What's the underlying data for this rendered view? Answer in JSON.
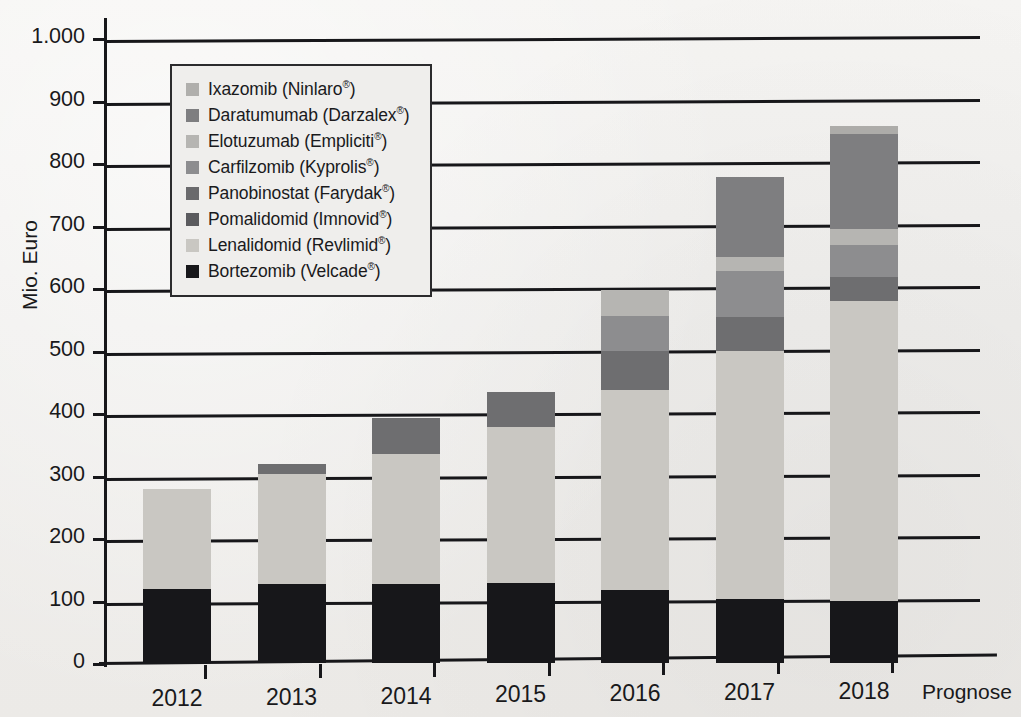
{
  "chart_data": {
    "type": "bar",
    "stacked": true,
    "title": "",
    "xlabel": "",
    "ylabel": "Mio. Euro",
    "ylim": [
      0,
      1000
    ],
    "ytick_labels": [
      "0",
      "100",
      "200",
      "300",
      "400",
      "500",
      "600",
      "700",
      "800",
      "900",
      "1.000"
    ],
    "ytick_values": [
      0,
      100,
      200,
      300,
      400,
      500,
      600,
      700,
      800,
      900,
      1000
    ],
    "grid": true,
    "legend_position": "upper-left-inside",
    "categories": [
      "2012",
      "2013",
      "2014",
      "2015",
      "2016",
      "2017",
      "2018"
    ],
    "annotation": "Prognose",
    "series": [
      {
        "name": "Bortezomib (Velcade®)",
        "color": "#17171a",
        "values": [
          118,
          127,
          127,
          128,
          117,
          103,
          100
        ]
      },
      {
        "name": "Lenalidomid (Revlimid®)",
        "color": "#c9c7c2",
        "values": [
          160,
          175,
          208,
          250,
          320,
          397,
          480
        ]
      },
      {
        "name": "Pomalidomid (Imnovid®)",
        "color": "#6e6e70",
        "values": [
          0,
          16,
          57,
          55,
          63,
          54,
          38
        ]
      },
      {
        "name": "Panobinostat (Farydak®)",
        "color": "#57575a",
        "values": [
          0,
          0,
          0,
          0,
          0,
          0,
          0
        ]
      },
      {
        "name": "Carfilzomib (Kyprolis®)",
        "color": "#8d8d8f",
        "values": [
          0,
          0,
          0,
          0,
          55,
          74,
          51
        ]
      },
      {
        "name": "Elotuzumab (Empliciti®)",
        "color": "#b6b5b2",
        "values": [
          0,
          0,
          0,
          0,
          42,
          22,
          25
        ]
      },
      {
        "name": "Daratumumab (Darzalex®)",
        "color": "#7e7e80",
        "values": [
          0,
          0,
          0,
          0,
          0,
          128,
          152
        ]
      },
      {
        "name": "Ixazomib (Ninlaro®)",
        "color": "#adaca9",
        "values": [
          0,
          0,
          0,
          0,
          0,
          0,
          14
        ]
      }
    ],
    "totals": [
      278,
      318,
      392,
      433,
      597,
      778,
      860
    ]
  },
  "legend": {
    "items": [
      {
        "label": "Ixazomib (Ninlaro®)",
        "color": "#b0afac"
      },
      {
        "label": "Daratumumab (Darzalex®)",
        "color": "#7e7e80"
      },
      {
        "label": "Elotuzumab (Empliciti®)",
        "color": "#b6b5b2"
      },
      {
        "label": "Carfilzomib (Kyprolis®)",
        "color": "#8d8d8f"
      },
      {
        "label": "Panobinostat (Farydak®)",
        "color": "#6a6a6c"
      },
      {
        "label": "Pomalidomid (Imnovid®)",
        "color": "#5b5b5e"
      },
      {
        "label": "Lenalidomid (Revlimid®)",
        "color": "#c9c7c2"
      },
      {
        "label": "Bortezomib (Velcade®)",
        "color": "#17171a"
      }
    ]
  },
  "axes": {
    "y_title": "Mio. Euro",
    "x_note": "Prognose"
  }
}
